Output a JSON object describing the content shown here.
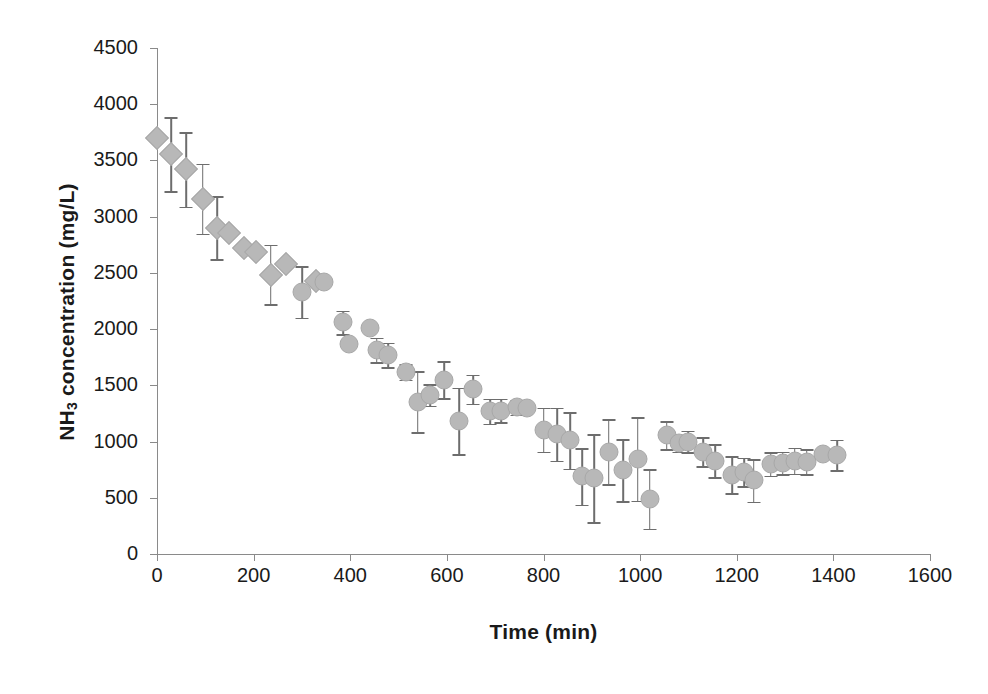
{
  "chart_data": {
    "type": "scatter",
    "title": "",
    "xlabel": "Time (min)",
    "ylabel": "NH3 concentration (mg/L)",
    "ylabel_prefix": "NH",
    "ylabel_sub": "3",
    "ylabel_suffix": " concentration (mg/L)",
    "xlim": [
      0,
      1600
    ],
    "ylim": [
      0,
      4500
    ],
    "xticks": [
      0,
      200,
      400,
      600,
      800,
      1000,
      1200,
      1400,
      1600
    ],
    "yticks": [
      0,
      500,
      1000,
      1500,
      2000,
      2500,
      3000,
      3500,
      4000,
      4500
    ],
    "xtick_labels": [
      "0",
      "200",
      "400",
      "600",
      "800",
      "1000",
      "1200",
      "1400",
      "1600"
    ],
    "ytick_labels": [
      "0",
      "500",
      "1000",
      "1500",
      "2000",
      "2500",
      "3000",
      "3500",
      "4000",
      "4500"
    ],
    "grid": false,
    "legend": false,
    "marker_color": "#b8b8b8",
    "errorbar_color": "#6d6d6d",
    "axis_color": "#8a8a8a",
    "series": [
      {
        "name": "NH3 concentration",
        "marker_early": "diamond",
        "marker_late": "circle",
        "points": [
          {
            "x": 0,
            "y": 3700,
            "err": 0,
            "marker": "diamond"
          },
          {
            "x": 30,
            "y": 3555,
            "err": 330,
            "marker": "diamond"
          },
          {
            "x": 60,
            "y": 3420,
            "err": 330,
            "marker": "diamond"
          },
          {
            "x": 95,
            "y": 3160,
            "err": 310,
            "marker": "diamond"
          },
          {
            "x": 125,
            "y": 2900,
            "err": 280,
            "marker": "diamond"
          },
          {
            "x": 150,
            "y": 2855,
            "err": 0,
            "marker": "diamond"
          },
          {
            "x": 180,
            "y": 2720,
            "err": 0,
            "marker": "diamond"
          },
          {
            "x": 205,
            "y": 2685,
            "err": 0,
            "marker": "diamond"
          },
          {
            "x": 235,
            "y": 2485,
            "err": 265,
            "marker": "diamond"
          },
          {
            "x": 268,
            "y": 2580,
            "err": 0,
            "marker": "diamond"
          },
          {
            "x": 300,
            "y": 2330,
            "err": 230,
            "marker": "circle"
          },
          {
            "x": 330,
            "y": 2425,
            "err": 0,
            "marker": "diamond"
          },
          {
            "x": 345,
            "y": 2420,
            "err": 0,
            "marker": "circle"
          },
          {
            "x": 385,
            "y": 2060,
            "err": 105,
            "marker": "circle"
          },
          {
            "x": 398,
            "y": 1865,
            "err": 0,
            "marker": "circle"
          },
          {
            "x": 440,
            "y": 2010,
            "err": 0,
            "marker": "circle"
          },
          {
            "x": 455,
            "y": 1815,
            "err": 110,
            "marker": "circle"
          },
          {
            "x": 478,
            "y": 1770,
            "err": 110,
            "marker": "circle"
          },
          {
            "x": 515,
            "y": 1620,
            "err": 70,
            "marker": "circle"
          },
          {
            "x": 540,
            "y": 1355,
            "err": 270,
            "marker": "circle"
          },
          {
            "x": 565,
            "y": 1415,
            "err": 95,
            "marker": "circle"
          },
          {
            "x": 595,
            "y": 1550,
            "err": 165,
            "marker": "circle"
          },
          {
            "x": 625,
            "y": 1185,
            "err": 295,
            "marker": "circle"
          },
          {
            "x": 655,
            "y": 1465,
            "err": 130,
            "marker": "circle"
          },
          {
            "x": 690,
            "y": 1270,
            "err": 110,
            "marker": "circle"
          },
          {
            "x": 712,
            "y": 1275,
            "err": 105,
            "marker": "circle"
          },
          {
            "x": 745,
            "y": 1305,
            "err": 65,
            "marker": "circle"
          },
          {
            "x": 765,
            "y": 1300,
            "err": 0,
            "marker": "circle"
          },
          {
            "x": 800,
            "y": 1105,
            "err": 195,
            "marker": "circle"
          },
          {
            "x": 828,
            "y": 1065,
            "err": 235,
            "marker": "circle"
          },
          {
            "x": 855,
            "y": 1010,
            "err": 250,
            "marker": "circle"
          },
          {
            "x": 880,
            "y": 690,
            "err": 250,
            "marker": "circle"
          },
          {
            "x": 905,
            "y": 675,
            "err": 390,
            "marker": "circle"
          },
          {
            "x": 935,
            "y": 910,
            "err": 290,
            "marker": "circle"
          },
          {
            "x": 965,
            "y": 745,
            "err": 275,
            "marker": "circle"
          },
          {
            "x": 995,
            "y": 845,
            "err": 370,
            "marker": "circle"
          },
          {
            "x": 1020,
            "y": 490,
            "err": 265,
            "marker": "circle"
          },
          {
            "x": 1055,
            "y": 1055,
            "err": 125,
            "marker": "circle"
          },
          {
            "x": 1080,
            "y": 985,
            "err": 75,
            "marker": "circle"
          },
          {
            "x": 1100,
            "y": 1000,
            "err": 95,
            "marker": "circle"
          },
          {
            "x": 1130,
            "y": 910,
            "err": 130,
            "marker": "circle"
          },
          {
            "x": 1155,
            "y": 830,
            "err": 145,
            "marker": "circle"
          },
          {
            "x": 1190,
            "y": 705,
            "err": 165,
            "marker": "circle"
          },
          {
            "x": 1215,
            "y": 730,
            "err": 125,
            "marker": "circle"
          },
          {
            "x": 1235,
            "y": 655,
            "err": 190,
            "marker": "circle"
          },
          {
            "x": 1270,
            "y": 800,
            "err": 105,
            "marker": "circle"
          },
          {
            "x": 1295,
            "y": 810,
            "err": 100,
            "marker": "circle"
          },
          {
            "x": 1320,
            "y": 830,
            "err": 115,
            "marker": "circle"
          },
          {
            "x": 1345,
            "y": 820,
            "err": 110,
            "marker": "circle"
          },
          {
            "x": 1378,
            "y": 890,
            "err": 0,
            "marker": "circle"
          },
          {
            "x": 1408,
            "y": 880,
            "err": 135,
            "marker": "circle"
          }
        ]
      }
    ]
  }
}
